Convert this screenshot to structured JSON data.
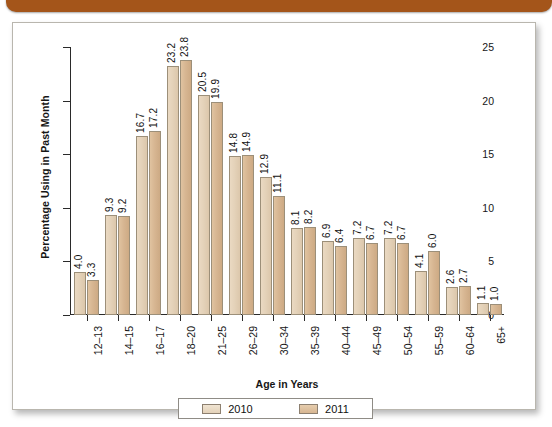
{
  "decor": {
    "top_bar_color": "#a4551a",
    "panel_background": "#ffffff"
  },
  "chart_data": {
    "type": "bar",
    "title": "",
    "xlabel": "Age in Years",
    "ylabel": "Percentage Using in Past Month",
    "ylim": [
      0,
      25
    ],
    "yticks": [
      0,
      5,
      10,
      15,
      20,
      25
    ],
    "ytick_labels": [
      "0",
      "5",
      "10",
      "15",
      "20",
      "25"
    ],
    "grid": false,
    "legend_position": "bottom-center",
    "categories": [
      "12–13",
      "14–15",
      "16–17",
      "18–20",
      "21–25",
      "26–29",
      "30–34",
      "35–39",
      "40–44",
      "45–49",
      "50–54",
      "55–59",
      "60–64",
      "65+"
    ],
    "series": [
      {
        "name": "2010",
        "color": "#e4d2b9",
        "values": [
          4.0,
          9.3,
          16.7,
          23.2,
          20.5,
          14.8,
          12.9,
          8.1,
          6.9,
          7.2,
          7.2,
          4.1,
          2.6,
          1.1
        ],
        "labels": [
          "4.0",
          "9.3",
          "16.7",
          "23.2",
          "20.5",
          "14.8",
          "12.9",
          "8.1",
          "6.9",
          "7.2",
          "7.2",
          "4.1",
          "2.6",
          "1.1"
        ]
      },
      {
        "name": "2011",
        "color": "#d7b692",
        "values": [
          3.3,
          9.2,
          17.2,
          23.8,
          19.9,
          14.9,
          11.1,
          8.2,
          6.4,
          6.7,
          6.7,
          6.0,
          2.7,
          1.0
        ],
        "labels": [
          "3.3",
          "9.2",
          "17.2",
          "23.8",
          "19.9",
          "14.9",
          "11.1",
          "8.2",
          "6.4",
          "6.7",
          "6.7",
          "6.0",
          "2.7",
          "1.0"
        ]
      }
    ]
  }
}
